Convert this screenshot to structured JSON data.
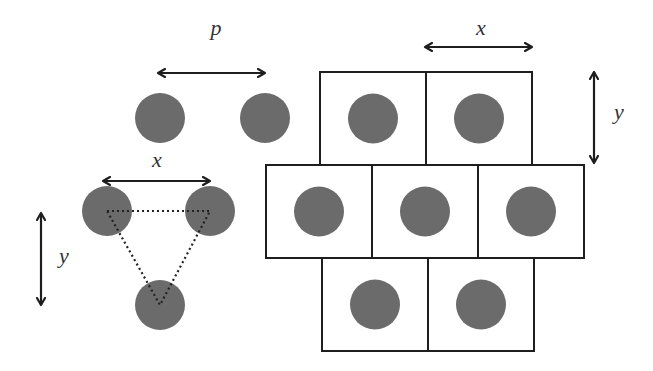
{
  "diagram": {
    "colors": {
      "circle_fill": "#6b6b6b",
      "line": "#1e1e1e",
      "background": "#ffffff",
      "label": "#333333"
    },
    "labels": {
      "pitch": "p",
      "x_left": "x",
      "y_left": "y",
      "x_right": "x",
      "y_right": "y"
    },
    "circle_radius": 25,
    "pitch_pair": {
      "circles": [
        [
          160,
          118
        ],
        [
          265,
          118
        ]
      ],
      "arrow": {
        "x1": 158,
        "x2": 265,
        "y": 73
      },
      "label_pos": [
        216,
        28
      ]
    },
    "triangle_group": {
      "circles": [
        [
          107,
          211
        ],
        [
          210,
          211
        ],
        [
          160,
          305
        ]
      ],
      "x_arrow": {
        "x1": 103,
        "x2": 210,
        "y": 181
      },
      "x_label_pos": [
        157,
        160
      ],
      "y_arrow": {
        "x": 41,
        "y1": 213,
        "y2": 305
      },
      "y_label_pos": [
        64,
        256
      ]
    },
    "grid": {
      "cell_width": 106,
      "cell_height": 93,
      "rows": [
        {
          "y": 72,
          "cells_x": [
            320,
            426
          ]
        },
        {
          "y": 165,
          "cells_x": [
            266,
            372,
            478
          ]
        },
        {
          "y": 258,
          "cells_x": [
            322,
            428
          ]
        }
      ],
      "x_arrow": {
        "x1": 425,
        "x2": 532,
        "y": 47
      },
      "x_label_pos": [
        481,
        28
      ],
      "y_arrow": {
        "x": 594,
        "y1": 72,
        "y2": 163
      },
      "y_label_pos": [
        619,
        112
      ]
    }
  }
}
